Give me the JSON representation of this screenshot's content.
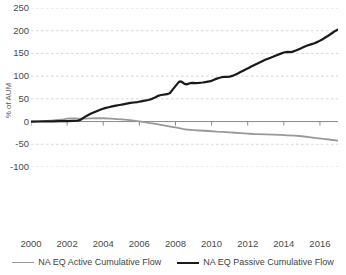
{
  "chart_data": {
    "type": "line",
    "title": "",
    "xlabel": "",
    "ylabel": "% of AUM",
    "xlim": [
      2000,
      2017
    ],
    "ylim": [
      -100,
      250
    ],
    "yticks": [
      250,
      200,
      150,
      100,
      50,
      0,
      -50,
      -100
    ],
    "ytick_labels": [
      "250",
      "200",
      "150",
      "100",
      "50",
      "0",
      "-50",
      "-100"
    ],
    "xticks": [
      2000,
      2002,
      2004,
      2006,
      2008,
      2010,
      2012,
      2014,
      2016
    ],
    "xtick_labels": [
      "2000",
      "2002",
      "2004",
      "2006",
      "2008",
      "2010",
      "2012",
      "2014",
      "2016"
    ],
    "grid": true,
    "grid_style": "dashed",
    "grid_color": "#cccccc",
    "legend_position": "bottom",
    "series": [
      {
        "name": "NA EQ Active Cumulative Flow",
        "color": "#999999",
        "width": 1.8,
        "x": [
          2000.0,
          2000.3,
          2000.6,
          2000.9,
          2001.2,
          2001.5,
          2001.8,
          2002.0,
          2002.2,
          2002.4,
          2002.6,
          2002.8,
          2003.0,
          2003.3,
          2003.6,
          2004.0,
          2004.4,
          2004.8,
          2005.2,
          2005.6,
          2006.0,
          2006.3,
          2006.6,
          2006.9,
          2007.2,
          2007.5,
          2007.8,
          2008.0,
          2008.2,
          2008.4,
          2008.6,
          2008.8,
          2009.0,
          2009.3,
          2009.6,
          2010.0,
          2010.3,
          2010.6,
          2011.0,
          2011.3,
          2011.6,
          2012.0,
          2012.3,
          2012.6,
          2013.0,
          2013.4,
          2013.8,
          2014.2,
          2014.6,
          2015.0,
          2015.4,
          2015.8,
          2016.2,
          2016.6,
          2017.0
        ],
        "y": [
          0.0,
          0.3,
          0.8,
          1.5,
          2.4,
          3.6,
          5.0,
          6.6,
          7.2,
          6.9,
          6.4,
          6.3,
          6.5,
          7.0,
          7.4,
          7.3,
          6.6,
          5.6,
          4.3,
          2.6,
          0.5,
          -1.4,
          -3.3,
          -5.3,
          -7.4,
          -9.6,
          -11.6,
          -13.0,
          -14.3,
          -16.2,
          -17.5,
          -18.2,
          -18.8,
          -19.6,
          -20.2,
          -21.3,
          -22.3,
          -22.8,
          -23.6,
          -24.6,
          -25.5,
          -26.6,
          -27.4,
          -27.7,
          -28.0,
          -28.6,
          -29.4,
          -30.2,
          -30.8,
          -32.3,
          -34.2,
          -36.3,
          -38.1,
          -40.0,
          -41.8
        ]
      },
      {
        "name": "NA EQ Passive Cumulative Flow",
        "color": "#1a1a1a",
        "width": 2.2,
        "x": [
          2000.0,
          2000.4,
          2000.8,
          2001.2,
          2001.6,
          2002.0,
          2002.3,
          2002.6,
          2002.75,
          2002.9,
          2003.1,
          2003.3,
          2003.5,
          2003.7,
          2003.9,
          2004.1,
          2004.3,
          2004.5,
          2004.7,
          2004.9,
          2005.1,
          2005.3,
          2005.5,
          2005.7,
          2005.9,
          2006.1,
          2006.3,
          2006.5,
          2006.7,
          2006.9,
          2007.0,
          2007.15,
          2007.3,
          2007.45,
          2007.6,
          2007.7,
          2007.8,
          2007.9,
          2008.0,
          2008.1,
          2008.2,
          2008.3,
          2008.4,
          2008.5,
          2008.6,
          2008.7,
          2008.8,
          2008.95,
          2009.1,
          2009.3,
          2009.5,
          2009.65,
          2009.8,
          2009.95,
          2010.1,
          2010.25,
          2010.4,
          2010.55,
          2010.7,
          2010.85,
          2011.0,
          2011.15,
          2011.3,
          2011.45,
          2011.6,
          2011.75,
          2011.9,
          2012.05,
          2012.2,
          2012.4,
          2012.6,
          2012.8,
          2013.0,
          2013.2,
          2013.4,
          2013.6,
          2013.8,
          2014.0,
          2014.2,
          2014.35,
          2014.5,
          2014.7,
          2014.9,
          2015.1,
          2015.3,
          2015.5,
          2015.7,
          2015.9,
          2016.1,
          2016.3,
          2016.5,
          2016.7,
          2016.85,
          2017.0
        ],
        "y": [
          0.0,
          0.2,
          0.4,
          0.6,
          0.8,
          1.0,
          1.4,
          2.0,
          4.0,
          8.0,
          13.0,
          17.0,
          20.5,
          24.0,
          27.0,
          29.5,
          31.5,
          33.5,
          35.0,
          36.5,
          38.0,
          39.5,
          41.0,
          42.0,
          43.0,
          44.5,
          46.0,
          47.5,
          50.0,
          53.5,
          56.0,
          58.0,
          59.0,
          60.0,
          61.0,
          63.0,
          68.0,
          73.0,
          78.0,
          83.0,
          87.5,
          88.5,
          86.0,
          83.0,
          82.0,
          83.0,
          84.5,
          85.0,
          84.5,
          85.0,
          86.0,
          87.0,
          88.0,
          89.0,
          91.5,
          94.0,
          96.0,
          97.5,
          98.5,
          98.5,
          99.0,
          100.5,
          103.0,
          106.0,
          109.0,
          112.0,
          115.0,
          118.0,
          121.0,
          125.0,
          129.0,
          133.0,
          136.5,
          139.5,
          142.5,
          146.0,
          149.0,
          152.0,
          153.5,
          153.0,
          154.0,
          157.0,
          160.5,
          164.0,
          167.5,
          170.0,
          172.5,
          176.0,
          180.0,
          185.0,
          190.0,
          195.5,
          199.5,
          202.5
        ]
      }
    ]
  },
  "legend": {
    "items": [
      {
        "label": "NA EQ Active Cumulative Flow",
        "color": "#999999"
      },
      {
        "label": "NA EQ Passive Cumulative Flow",
        "color": "#1a1a1a"
      }
    ]
  }
}
